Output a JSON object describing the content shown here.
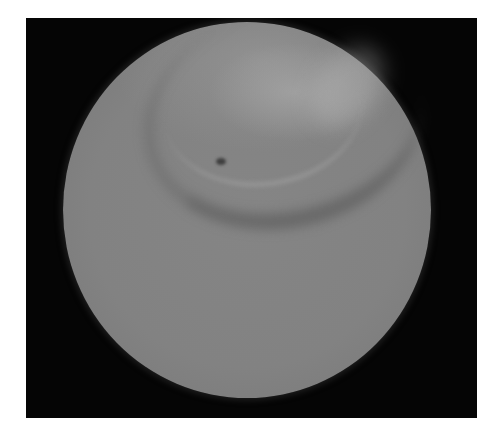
{
  "image": {
    "description": "Grayscale circular endoscopic-style view on black background",
    "frame_color": "#050505",
    "disc_base_color": "#828282",
    "highlight_color": "#a8a8a8",
    "shadow_color": "#464646",
    "features": [
      "curved-fold",
      "small-dark-pit",
      "upper-right-bright-rim"
    ]
  }
}
